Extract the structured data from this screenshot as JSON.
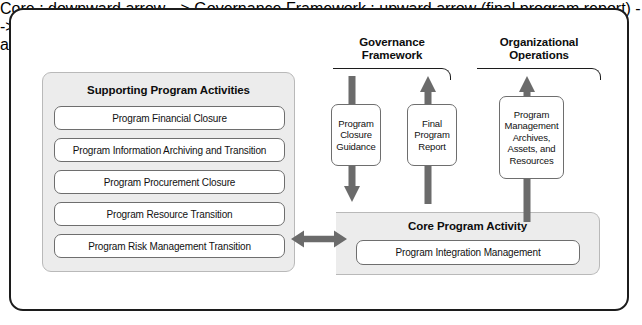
{
  "diagram": {
    "title_hidden": "",
    "colors": {
      "frame_border": "#1c1c1c",
      "panel_fill": "#ececec",
      "panel_border": "#b9b9b9",
      "box_border": "#6e6e6e",
      "arrow_fill": "#6b6b6b",
      "text": "#111111"
    }
  },
  "supporting": {
    "heading": "Supporting Program Activities",
    "items": [
      {
        "label": "Program Financial Closure"
      },
      {
        "label": "Program Information Archiving and Transition"
      },
      {
        "label": "Program Procurement Closure"
      },
      {
        "label": "Program Resource Transition"
      },
      {
        "label": "Program Risk Management Transition"
      }
    ]
  },
  "core": {
    "heading": "Core Program Activity",
    "items": [
      {
        "label": "Program Integration Management"
      }
    ]
  },
  "brackets": [
    {
      "label_line_1": "Governance",
      "label_line_2": "Framework"
    },
    {
      "label_line_1": "Organizational",
      "label_line_2": "Operations"
    }
  ],
  "flows": [
    {
      "name": "program-closure-guidance",
      "line_1": "Program",
      "line_2": "Closure",
      "line_3": "Guidance",
      "direction": "down"
    },
    {
      "name": "final-program-report",
      "line_1": "Final",
      "line_2": "Program",
      "line_3": "Report",
      "direction": "up"
    },
    {
      "name": "program-management-archives",
      "line_1": "Program",
      "line_2": "Management",
      "line_3": "Archives,",
      "line_4": "Assets, and",
      "line_5": "Resources",
      "direction": "up"
    }
  ],
  "connectors": [
    {
      "name": "supporting-to-core",
      "direction": "bidirectional"
    }
  ]
}
